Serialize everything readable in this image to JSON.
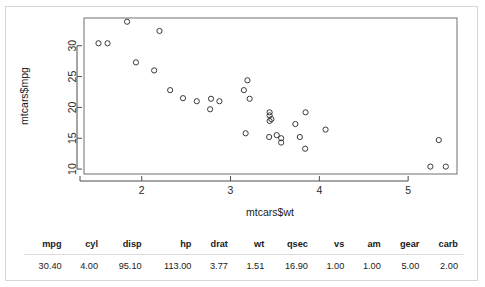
{
  "chart_data": {
    "type": "scatter",
    "title": "",
    "xlabel": "mtcars$wt",
    "ylabel": "mtcars$mpg",
    "xlim": [
      1.35,
      5.55
    ],
    "ylim": [
      9.2,
      34.5
    ],
    "xticks": [
      2,
      3,
      4,
      5
    ],
    "yticks": [
      10,
      15,
      20,
      25,
      30
    ],
    "grid": false,
    "legend": null,
    "marker": "open-circle",
    "points": [
      {
        "x": 2.62,
        "y": 21.0
      },
      {
        "x": 2.875,
        "y": 21.0
      },
      {
        "x": 2.32,
        "y": 22.8
      },
      {
        "x": 3.215,
        "y": 21.4
      },
      {
        "x": 3.44,
        "y": 18.7
      },
      {
        "x": 3.46,
        "y": 18.1
      },
      {
        "x": 3.57,
        "y": 14.3
      },
      {
        "x": 3.19,
        "y": 24.4
      },
      {
        "x": 3.15,
        "y": 22.8
      },
      {
        "x": 3.44,
        "y": 19.2
      },
      {
        "x": 3.44,
        "y": 17.8
      },
      {
        "x": 4.07,
        "y": 16.4
      },
      {
        "x": 3.73,
        "y": 17.3
      },
      {
        "x": 3.78,
        "y": 15.2
      },
      {
        "x": 5.25,
        "y": 10.4
      },
      {
        "x": 5.424,
        "y": 10.4
      },
      {
        "x": 5.345,
        "y": 14.7
      },
      {
        "x": 2.2,
        "y": 32.4
      },
      {
        "x": 1.615,
        "y": 30.4
      },
      {
        "x": 1.835,
        "y": 33.9
      },
      {
        "x": 2.465,
        "y": 21.5
      },
      {
        "x": 3.52,
        "y": 15.5
      },
      {
        "x": 3.435,
        "y": 15.2
      },
      {
        "x": 3.84,
        "y": 13.3
      },
      {
        "x": 3.845,
        "y": 19.2
      },
      {
        "x": 1.935,
        "y": 27.3
      },
      {
        "x": 2.14,
        "y": 26.0
      },
      {
        "x": 1.513,
        "y": 30.4
      },
      {
        "x": 3.17,
        "y": 15.8
      },
      {
        "x": 2.77,
        "y": 19.7
      },
      {
        "x": 3.57,
        "y": 15.0
      },
      {
        "x": 2.78,
        "y": 21.4
      }
    ]
  },
  "table": {
    "columns": [
      "mpg",
      "cyl",
      "disp",
      "hp",
      "drat",
      "wt",
      "qsec",
      "vs",
      "am",
      "gear",
      "carb"
    ],
    "rows": [
      [
        "30.40",
        "4.00",
        "95.10",
        "113.00",
        "3.77",
        "1.51",
        "16.90",
        "1.00",
        "1.00",
        "5.00",
        "2.00"
      ]
    ]
  }
}
